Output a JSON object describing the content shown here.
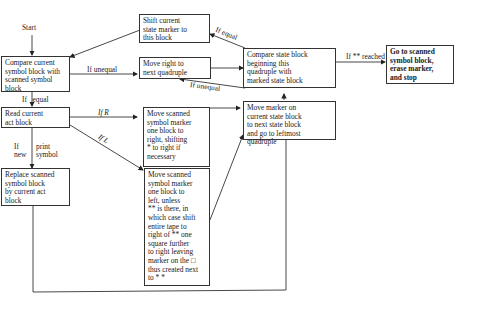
{
  "start_label": "Start",
  "boxes": {
    "compare_symbol": "Compare current\nsymbol block with\nscanned symbol\nblock",
    "shift_state": "Shift current\nstate marker to\nthis block",
    "move_right_quad": "Move right to\nnext quadruple",
    "compare_state": "Compare state block\nbeginning this\nquadruple with\nmarked state block",
    "goto_stop": "Go to scanned\nsymbol block,\nerase marker,\nand stop",
    "read_act": "Read current\nact block",
    "move_marker_right": "Move scanned\nsymbol marker\none block to\nright, shifting\n* to right if\nnecessary",
    "move_state_marker": "Move marker on\ncurrent state block\nto next state block\nand go to leftmost\nquadruple",
    "replace_symbol": "Replace scanned\nsymbol block\nby current act\nblock",
    "move_marker_left": "Move scanned\nsymbol marker\none block to\nleft, unless\n** is there, in\nwhich case shift\nentire tape to\nright of ** one\nsquare further\nto right leaving\nmarker on the □\nthus created next\nto * *"
  },
  "edge_labels": {
    "if_unequal_1": "If unequal",
    "if_equal_top": "If equal",
    "if_unequal_2": "If unequal",
    "if_reached": "If ** reached",
    "if_equal_left": "If   equal",
    "if_r": "If R",
    "if_l": "If L",
    "if_new": "If\nnew",
    "print_symbol": "print\nsymbol"
  }
}
